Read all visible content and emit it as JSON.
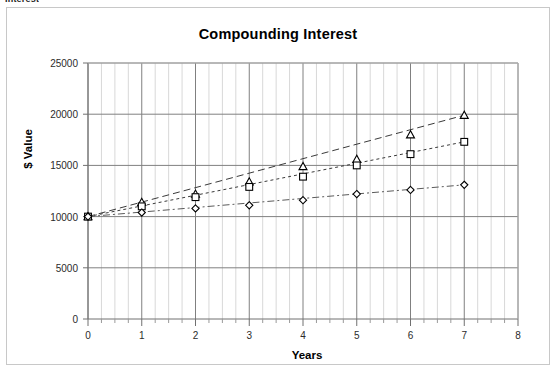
{
  "clipped_header_text": "Interest",
  "chart_data": {
    "type": "line",
    "title": "Compounding Interest",
    "xlabel": "Years",
    "ylabel": "$ Value",
    "xlim": [
      0,
      8
    ],
    "ylim": [
      0,
      25000
    ],
    "xticks": [
      "0",
      "1",
      "2",
      "3",
      "4",
      "5",
      "6",
      "7",
      "8"
    ],
    "yticks": [
      "0",
      "5000",
      "10000",
      "15000",
      "20000",
      "25000"
    ],
    "grid": "major horizontal and major/minor vertical",
    "legend": "none",
    "x": [
      0,
      1,
      2,
      3,
      4,
      5,
      6,
      7
    ],
    "series": [
      {
        "name": "series-triangle",
        "marker": "triangle",
        "line_style": "dashed",
        "color": "#3a3a3a",
        "values": [
          10000,
          11400,
          12200,
          13400,
          14900,
          15600,
          18000,
          19900
        ]
      },
      {
        "name": "series-square",
        "marker": "square",
        "line_style": "dotted",
        "color": "#3a3a3a",
        "values": [
          10000,
          11000,
          11900,
          12900,
          13900,
          15000,
          16100,
          17300
        ]
      },
      {
        "name": "series-diamond",
        "marker": "diamond",
        "line_style": "dash-dot",
        "color": "#5a5a5a",
        "values": [
          10000,
          10400,
          10800,
          11100,
          11600,
          12200,
          12600,
          13100
        ]
      }
    ]
  },
  "colors": {
    "frame_border": "#c8c8c8",
    "plot_border": "#9a9a9a",
    "major_grid": "#808080",
    "minor_grid": "#d8d8d8",
    "text": "#000000"
  }
}
